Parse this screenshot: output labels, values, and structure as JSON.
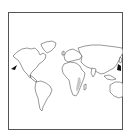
{
  "map": {
    "type": "world-outline",
    "projection": "equirectangular-cropped",
    "frame": {
      "stroke_color": "#555555",
      "background": "#ffffff"
    },
    "land_stroke_color": "#444444",
    "highlight_region": {
      "name": "east-africa-shaded",
      "color": "#c8c8c8"
    },
    "markers": [
      {
        "name": "pacific-west-marker",
        "color": "#111111",
        "approx_px": [
          14,
          68
        ]
      },
      {
        "name": "pacific-east-marker",
        "color": "#111111",
        "approx_px": [
          119,
          67
        ]
      }
    ],
    "continents": [
      "North America",
      "South America",
      "Europe",
      "Africa",
      "Asia",
      "Australia"
    ]
  }
}
